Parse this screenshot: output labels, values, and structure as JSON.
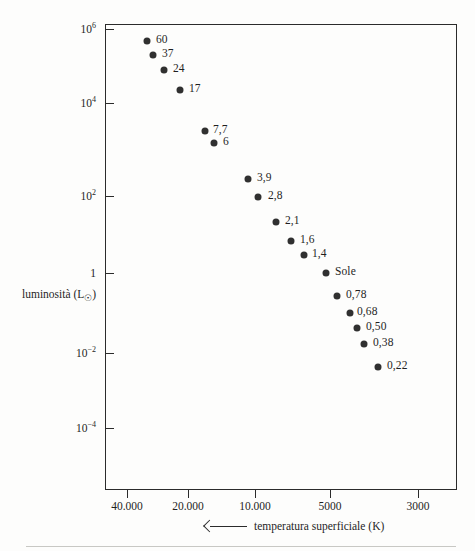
{
  "chart_data": {
    "type": "scatter",
    "title": "",
    "xlabel": "temperatura superficiale (K)",
    "ylabel": "luminosità (L☉)",
    "x_axis": {
      "label": "temperatura superficiale (K)",
      "direction_arrow": "left",
      "scale": "log-reversed",
      "tick_labels": [
        "40.000",
        "20.000",
        "10.000",
        "5000",
        "3000"
      ],
      "tick_values": [
        40000,
        20000,
        10000,
        5000,
        3000
      ],
      "tick_x_px": [
        127,
        188,
        255,
        330,
        418
      ]
    },
    "y_axis": {
      "label": "luminosità (L☉)",
      "scale": "log",
      "tick_labels": [
        "10⁶",
        "10⁴",
        "10²",
        "1",
        "10⁻²",
        "10⁻⁴"
      ],
      "tick_mantissas": [
        "10",
        "10",
        "10",
        "1",
        "10",
        "10"
      ],
      "tick_exponents": [
        "6",
        "4",
        "2",
        "",
        "-2",
        "-4"
      ],
      "tick_values": [
        1000000,
        10000,
        100,
        1,
        0.01,
        0.0001
      ],
      "tick_y_px": [
        29,
        103,
        196,
        273,
        353,
        428
      ]
    },
    "grid": false,
    "legend": false,
    "points": [
      {
        "label": "60",
        "mass": 60,
        "temperature": 33000,
        "luminosity": 300000,
        "x_px": 147,
        "y_px": 41,
        "label_dx": 9,
        "label_dy": -1
      },
      {
        "label": "37",
        "mass": 37,
        "temperature": 30000,
        "luminosity": 160000,
        "x_px": 153,
        "y_px": 55,
        "label_dx": 9,
        "label_dy": -1
      },
      {
        "label": "24",
        "mass": 24,
        "temperature": 26000,
        "luminosity": 70000,
        "x_px": 164,
        "y_px": 70,
        "label_dx": 9,
        "label_dy": -1
      },
      {
        "label": "17",
        "mass": 17,
        "temperature": 21000,
        "luminosity": 25000,
        "x_px": 180,
        "y_px": 90,
        "label_dx": 9,
        "label_dy": -1
      },
      {
        "label": "7,7",
        "mass": 7.7,
        "temperature": 15000,
        "luminosity": 1700,
        "x_px": 205,
        "y_px": 131,
        "label_dx": 8,
        "label_dy": -1
      },
      {
        "label": "6",
        "mass": 6,
        "temperature": 14000,
        "luminosity": 1000,
        "x_px": 214,
        "y_px": 143,
        "label_dx": 9,
        "label_dy": -1
      },
      {
        "label": "3,9",
        "mass": 3.9,
        "temperature": 11000,
        "luminosity": 190,
        "x_px": 248,
        "y_px": 179,
        "label_dx": 9,
        "label_dy": -1
      },
      {
        "label": "2,8",
        "mass": 2.8,
        "temperature": 10000,
        "luminosity": 90,
        "x_px": 258,
        "y_px": 197,
        "label_dx": 10,
        "label_dy": -1
      },
      {
        "label": "2,1",
        "mass": 2.1,
        "temperature": 8500,
        "luminosity": 23,
        "x_px": 276,
        "y_px": 222,
        "label_dx": 9,
        "label_dy": -1
      },
      {
        "label": "1,6",
        "mass": 1.6,
        "temperature": 7500,
        "luminosity": 7.5,
        "x_px": 291,
        "y_px": 241,
        "label_dx": 9,
        "label_dy": -1
      },
      {
        "label": "1,4",
        "mass": 1.4,
        "temperature": 7000,
        "luminosity": 4,
        "x_px": 304,
        "y_px": 255,
        "label_dx": 8,
        "label_dy": -1
      },
      {
        "label": "Sole",
        "mass": 1,
        "temperature": 5800,
        "luminosity": 1,
        "x_px": 326,
        "y_px": 273,
        "label_dx": 9,
        "label_dy": -1
      },
      {
        "label": "0,78",
        "mass": 0.78,
        "temperature": 5200,
        "luminosity": 0.33,
        "x_px": 337,
        "y_px": 296,
        "label_dx": 9,
        "label_dy": -1
      },
      {
        "label": "0,68",
        "mass": 0.68,
        "temperature": 4800,
        "luminosity": 0.17,
        "x_px": 350,
        "y_px": 313,
        "label_dx": 7,
        "label_dy": -1
      },
      {
        "label": "0,50",
        "mass": 0.5,
        "temperature": 4400,
        "luminosity": 0.09,
        "x_px": 357,
        "y_px": 328,
        "label_dx": 9,
        "label_dy": -1
      },
      {
        "label": "0,38",
        "mass": 0.38,
        "temperature": 4000,
        "luminosity": 0.045,
        "x_px": 364,
        "y_px": 344,
        "label_dx": 9,
        "label_dy": -1
      },
      {
        "label": "0,22",
        "mass": 0.22,
        "temperature": 3500,
        "luminosity": 0.006,
        "x_px": 378,
        "y_px": 367,
        "label_dx": 9,
        "label_dy": -1
      }
    ]
  },
  "colors": {
    "point": "#303030",
    "axis": "#2b2b2b",
    "text": "#1f1f1f",
    "background": "#fdfdfc",
    "rule": "#c8c8c4"
  }
}
